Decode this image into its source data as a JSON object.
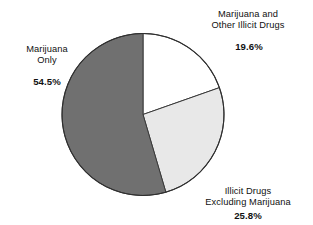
{
  "chart_data": {
    "type": "pie",
    "title": "",
    "subtitle": "",
    "xlabel": "",
    "ylabel": "",
    "legend_position": "none",
    "grid": false,
    "start_angle_deg": 0,
    "direction": "clockwise",
    "categories": [
      "Marijuana and Other Illicit Drugs",
      "Illicit Drugs Excluding Marijuana",
      "Marijuana Only"
    ],
    "values": [
      19.6,
      25.8,
      54.5
    ],
    "value_suffix": "%",
    "slice_colors": [
      "#ffffff",
      "#e8e8e8",
      "#707070"
    ],
    "slice_outline_color": "#3a3a3a",
    "slices": [
      {
        "name": "Marijuana and Other Illicit Drugs",
        "value": 19.6,
        "value_label": "19.6%",
        "color": "#ffffff"
      },
      {
        "name": "Illicit Drugs Excluding Marijuana",
        "value": 25.8,
        "value_label": "25.8%",
        "color": "#e8e8e8"
      },
      {
        "name": "Marijuana Only",
        "value": 54.5,
        "value_label": "54.5%",
        "color": "#707070"
      }
    ]
  },
  "labels": {
    "marijuana_other": {
      "line1": "Marijuana and",
      "line2": "Other Illicit Drugs",
      "value": "19.6%"
    },
    "marijuana_only": {
      "line1": "Marijuana",
      "line2": "Only",
      "value": "54.5%"
    },
    "illicit_excluding": {
      "line1": "Illicit Drugs",
      "line2": "Excluding Marijuana",
      "value": "25.8%"
    }
  },
  "geometry": {
    "center_x": 143,
    "center_y": 114.5,
    "radius": 81
  }
}
